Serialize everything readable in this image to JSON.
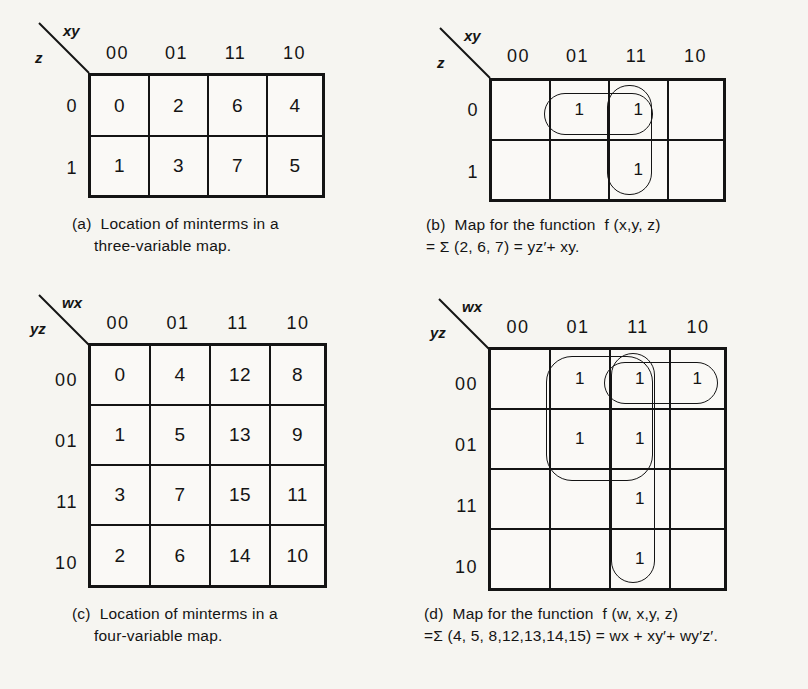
{
  "figure": {
    "kind": "karnaugh-map-figure",
    "background_color": "#f6f5f1",
    "ink_color": "#141414"
  },
  "panels": [
    {
      "id": "a",
      "tag": "(a)",
      "top_variable_label": "xy",
      "left_variable_label": "z",
      "column_headers": [
        "00",
        "01",
        "11",
        "10"
      ],
      "row_headers": [
        "0",
        "1"
      ],
      "cells": [
        [
          "0",
          "2",
          "6",
          "4"
        ],
        [
          "1",
          "3",
          "7",
          "5"
        ]
      ],
      "caption_line1": "(a)  Location of minterms in a",
      "caption_line2": "three-variable map.",
      "loops": []
    },
    {
      "id": "b",
      "tag": "(b)",
      "top_variable_label": "xy",
      "left_variable_label": "z",
      "column_headers": [
        "00",
        "01",
        "11",
        "10"
      ],
      "row_headers": [
        "0",
        "1"
      ],
      "cells": [
        [
          "",
          "1",
          "1",
          ""
        ],
        [
          "",
          "",
          "1",
          ""
        ]
      ],
      "caption_line1": "(b)  Map for the function  f (x,y, z)",
      "caption_line2": "= Σ (2, 6, 7) = yz′+ xy.",
      "function_name": "f (x,y, z)",
      "minterms": [
        2,
        6,
        7
      ],
      "expression": "yz′+ xy",
      "loops": [
        {
          "name": "loop-yz-prime",
          "orientation": "horizontal",
          "cols": [
            "01",
            "11"
          ],
          "rows": [
            "0"
          ]
        },
        {
          "name": "loop-xy",
          "orientation": "vertical",
          "cols": [
            "11"
          ],
          "rows": [
            "0",
            "1"
          ]
        }
      ]
    },
    {
      "id": "c",
      "tag": "(c)",
      "top_variable_label": "wx",
      "left_variable_label": "yz",
      "column_headers": [
        "00",
        "01",
        "11",
        "10"
      ],
      "row_headers": [
        "00",
        "01",
        "11",
        "10"
      ],
      "cells": [
        [
          "0",
          "4",
          "12",
          "8"
        ],
        [
          "1",
          "5",
          "13",
          "9"
        ],
        [
          "3",
          "7",
          "15",
          "11"
        ],
        [
          "2",
          "6",
          "14",
          "10"
        ]
      ],
      "caption_line1": "(c)  Location of minterms in a",
      "caption_line2": "four-variable map.",
      "loops": []
    },
    {
      "id": "d",
      "tag": "(d)",
      "top_variable_label": "wx",
      "left_variable_label": "yz",
      "column_headers": [
        "00",
        "01",
        "11",
        "10"
      ],
      "row_headers": [
        "00",
        "01",
        "11",
        "10"
      ],
      "cells": [
        [
          "",
          "1",
          "1",
          "1"
        ],
        [
          "",
          "1",
          "1",
          ""
        ],
        [
          "",
          "",
          "1",
          ""
        ],
        [
          "",
          "",
          "1",
          ""
        ]
      ],
      "caption_line1": "(d)  Map for the function  f (w, x,y, z)",
      "caption_line2": "=Σ (4, 5, 8,12,13,14,15) = wx + xy′+ wy′z′.",
      "function_name": "f (w, x,y, z)",
      "minterms": [
        4,
        5,
        8,
        12,
        13,
        14,
        15
      ],
      "expression": "wx + xy′+ wy′z′",
      "loops": [
        {
          "name": "loop-xy-prime",
          "orientation": "block",
          "cols": [
            "01",
            "11"
          ],
          "rows": [
            "00",
            "01"
          ]
        },
        {
          "name": "loop-wy-prime-z-prime",
          "orientation": "horizontal",
          "cols": [
            "11",
            "10"
          ],
          "rows": [
            "00"
          ]
        },
        {
          "name": "loop-wx",
          "orientation": "vertical",
          "cols": [
            "11"
          ],
          "rows": [
            "00",
            "01",
            "11",
            "10"
          ]
        }
      ]
    }
  ]
}
